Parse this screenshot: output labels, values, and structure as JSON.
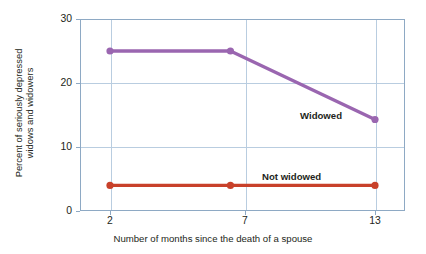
{
  "chart_data": {
    "type": "line",
    "title": "",
    "xlabel": "Number of months since the death of a spouse",
    "ylabel_line1": "Percent of seriously depressed",
    "ylabel_line2": "widows and widowers",
    "x": [
      2,
      7,
      13
    ],
    "xtick_labels": [
      "2",
      "7",
      "13"
    ],
    "ytick_labels": [
      "30",
      "20",
      "10",
      "0"
    ],
    "ytick_values": [
      30,
      20,
      10,
      0
    ],
    "xlim": [
      0,
      15.5
    ],
    "ylim": [
      0,
      30
    ],
    "grid": "both",
    "legend_position": "inline-annotations",
    "series": [
      {
        "name": "Widowed",
        "color": "#9a66b0",
        "values": [
          25.0,
          25.0,
          14.3
        ],
        "label_x": 300,
        "label_y": 110
      },
      {
        "name": "Not widowed",
        "color": "#c8412a",
        "values": [
          4.0,
          4.0,
          4.0
        ],
        "label_x": 262,
        "label_y": 171
      }
    ],
    "axis_color": "#8ea9c4",
    "grid_color": "#b9cde0",
    "background": "#ffffff"
  }
}
